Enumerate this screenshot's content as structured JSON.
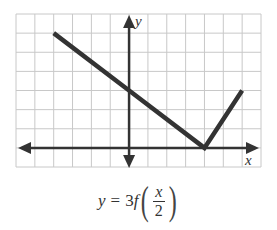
{
  "chart_data": {
    "type": "line",
    "title": "",
    "xlabel": "x",
    "ylabel": "y",
    "xlim": [
      -6,
      7
    ],
    "ylim": [
      -1,
      7
    ],
    "grid": true,
    "grid_step": 1,
    "series": [
      {
        "name": "y = 3f(x/2)",
        "points": [
          [
            -4,
            6
          ],
          [
            0,
            3
          ],
          [
            4,
            0
          ],
          [
            6,
            3
          ]
        ],
        "color": "#333333"
      }
    ],
    "caption": "y = 3f(x/2)"
  },
  "labels": {
    "x_axis": "x",
    "y_axis": "y"
  },
  "caption": {
    "lhs": "y",
    "equals": "=",
    "coef": "3",
    "func": "f",
    "num": "x",
    "den": "2",
    "lparen": "(",
    "rparen": ")"
  },
  "colors": {
    "grid": "#c8c8c8",
    "axis": "#333333",
    "line": "#333333"
  }
}
